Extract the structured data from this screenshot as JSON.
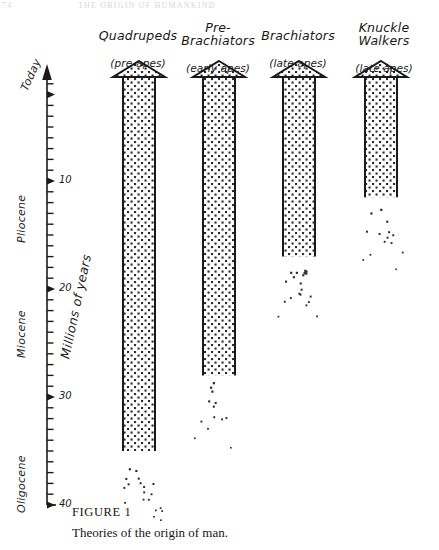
{
  "running_head": {
    "folio": "74",
    "title": "THE ORIGIN OF HUMANKIND"
  },
  "caption": {
    "figure_number": "FIGURE  1",
    "text": "Theories of the origin of man."
  },
  "axis": {
    "title": "Millions of years",
    "top_label": "Today",
    "tick_labels": [
      "10",
      "20",
      "30",
      "40"
    ],
    "tick_values": [
      10,
      20,
      30,
      40
    ],
    "minor_tick_step": 1,
    "epochs": [
      {
        "name": "Pliocene",
        "from": 0,
        "to": 13
      },
      {
        "name": "Miocene",
        "from": 13,
        "to": 27
      },
      {
        "name": "Oligocene",
        "from": 27,
        "to": 40
      }
    ]
  },
  "columns": [
    {
      "name": "Quadrupeds",
      "subtitle": "(pre-apes)",
      "origin_mya": 35.0
    },
    {
      "name": "Pre-\nBrachiators",
      "subtitle": "(early apes)",
      "origin_mya": 28.0
    },
    {
      "name": "Brachiators",
      "subtitle": "(late apes)",
      "origin_mya": 17.0
    },
    {
      "name": "Knuckle\nWalkers",
      "subtitle": "(late apes)",
      "origin_mya": 11.5
    }
  ],
  "colors": {
    "ink": "#1a1a1a",
    "paper": "#ffffff",
    "stipple": "#2b2b2b",
    "running_head": "#c9c9cf"
  },
  "chart_data": {
    "type": "bar",
    "title": "Theories of the origin of man.",
    "xlabel": "",
    "ylabel": "Millions of years",
    "ylim": [
      0,
      40
    ],
    "y_inverted": true,
    "grid": false,
    "legend": false,
    "categories": [
      "Quadrupeds (pre-apes)",
      "Pre-Brachiators (early apes)",
      "Brachiators (late apes)",
      "Knuckle Walkers (late apes)"
    ],
    "values": [
      35.0,
      28.0,
      17.0,
      11.5
    ],
    "value_note": "Each bar is an upward arrow spanning from its origin (millions of years ago) to Today (0); the lower end dissolves into scattered stipple indicating an uncertain origin date.",
    "tick_labels": [
      "Today",
      "10",
      "20",
      "30",
      "40"
    ],
    "tick_values": [
      0,
      10,
      20,
      30,
      40
    ],
    "annotations": [
      {
        "text": "Pliocene",
        "axis": "y",
        "range": [
          0,
          13
        ]
      },
      {
        "text": "Miocene",
        "axis": "y",
        "range": [
          13,
          27
        ]
      },
      {
        "text": "Oligocene",
        "axis": "y",
        "range": [
          27,
          40
        ]
      }
    ]
  }
}
